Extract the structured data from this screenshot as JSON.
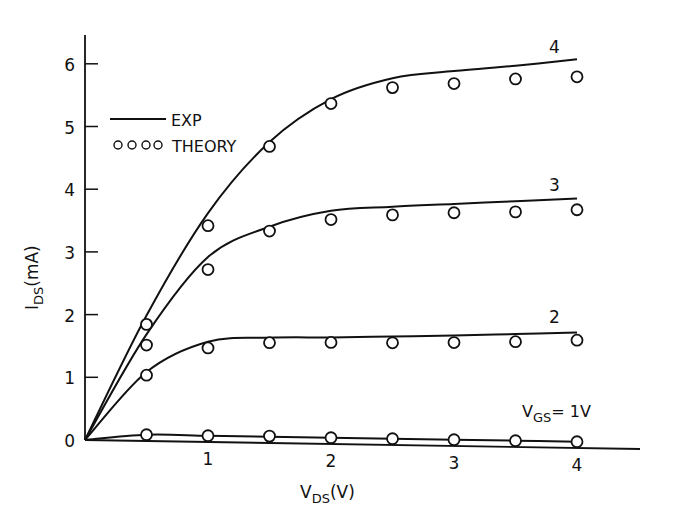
{
  "chart_data": {
    "type": "line",
    "title": "",
    "xlabel": "V_DS(V)",
    "ylabel": "I_DS(mA)",
    "xlabel_main": "V",
    "xlabel_sub": "DS",
    "xlabel_unit": "(V)",
    "ylabel_main": "I",
    "ylabel_sub": "DS",
    "ylabel_unit": "(mA)",
    "xlim": [
      0,
      4.4
    ],
    "ylim": [
      0,
      6.5
    ],
    "xticks": [
      1,
      2,
      3,
      4
    ],
    "yticks": [
      0,
      1,
      2,
      3,
      4,
      5,
      6
    ],
    "grid": false,
    "legend": {
      "position": "upper-left",
      "entries": [
        {
          "label": "EXP",
          "style": "solid-line"
        },
        {
          "label": "THEORY",
          "style": "open-circles",
          "marker_text": "oooo"
        }
      ]
    },
    "series": [
      {
        "name": "V_GS = 4",
        "curve_label": "4",
        "exp_x": [
          0,
          0.5,
          1.0,
          1.5,
          2.0,
          2.5,
          3.0,
          3.5,
          4.0
        ],
        "exp_y": [
          0,
          2.0,
          3.65,
          4.8,
          5.5,
          5.85,
          5.98,
          6.08,
          6.2
        ],
        "theory_x": [
          0.5,
          1.0,
          1.5,
          2.0,
          2.5,
          3.0,
          3.5,
          4.0
        ],
        "theory_y": [
          1.86,
          3.45,
          4.73,
          5.43,
          5.7,
          5.78,
          5.87,
          5.92
        ]
      },
      {
        "name": "V_GS = 3",
        "curve_label": "3",
        "exp_x": [
          0,
          0.5,
          1.0,
          1.5,
          2.0,
          2.5,
          3.0,
          3.5,
          4.0
        ],
        "exp_y": [
          0,
          1.7,
          2.95,
          3.45,
          3.72,
          3.8,
          3.86,
          3.92,
          3.98
        ],
        "theory_x": [
          0.5,
          1.0,
          1.5,
          2.0,
          2.5,
          3.0,
          3.5,
          4.0
        ],
        "theory_y": [
          1.53,
          2.75,
          3.38,
          3.58,
          3.67,
          3.72,
          3.75,
          3.8
        ]
      },
      {
        "name": "V_GS = 2",
        "curve_label": "2",
        "exp_x": [
          0,
          0.5,
          1.0,
          1.5,
          2.0,
          2.5,
          3.0,
          3.5,
          4.0
        ],
        "exp_y": [
          0,
          1.1,
          1.6,
          1.68,
          1.7,
          1.73,
          1.76,
          1.8,
          1.84
        ],
        "theory_x": [
          0.5,
          1.0,
          1.5,
          2.0,
          2.5,
          3.0,
          3.5,
          4.0
        ],
        "theory_y": [
          1.05,
          1.5,
          1.6,
          1.62,
          1.63,
          1.65,
          1.68,
          1.72
        ]
      },
      {
        "name": "V_GS = 1V",
        "curve_label": "V_GS = 1V",
        "exp_x": [
          0,
          0.5,
          1.0,
          1.5,
          2.0,
          2.5,
          3.0,
          3.5,
          4.0
        ],
        "exp_y": [
          0,
          0.1,
          0.1,
          0.1,
          0.1,
          0.1,
          0.1,
          0.1,
          0.1
        ],
        "theory_x": [
          0.5,
          1.0,
          1.5,
          2.0,
          2.5,
          3.0,
          3.5,
          4.0
        ],
        "theory_y": [
          0.1,
          0.1,
          0.11,
          0.1,
          0.1,
          0.1,
          0.1,
          0.1
        ]
      }
    ],
    "annotations": [
      {
        "text": "4",
        "near": "end of V_GS=4 curve"
      },
      {
        "text": "3",
        "near": "end of V_GS=3 curve"
      },
      {
        "text": "2",
        "near": "end of V_GS=2 curve"
      },
      {
        "text": "V_GS = 1V",
        "near": "end of V_GS=1 curve",
        "main": "V",
        "sub": "GS",
        "rest": "= 1V"
      }
    ]
  },
  "colors": {
    "ink": "#111111",
    "background": "#ffffff"
  }
}
